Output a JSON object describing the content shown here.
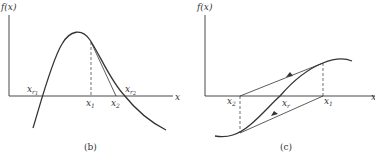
{
  "panel_b": {
    "ylabel": "f(x)",
    "xlabel": "x",
    "labels": {
      "xr1": "x",
      "xr1_sub": "r",
      "xr1_subsub": "1",
      "x1": "x",
      "x1_sub": "1",
      "x2": "x",
      "x2_sub": "2",
      "xr2": "x",
      "xr2_sub": "r",
      "xr2_subsub": "2"
    },
    "caption": "(b)"
  },
  "panel_c": {
    "ylabel": "f(x)",
    "xlabel": "x",
    "labels": {
      "x2": "x",
      "x2_sub": "2",
      "xr": "x",
      "xr_sub": "r",
      "x1": "x",
      "x1_sub": "1"
    },
    "caption": "(c)"
  },
  "colors": {
    "stroke": "#333333",
    "background": "#ffffff"
  }
}
